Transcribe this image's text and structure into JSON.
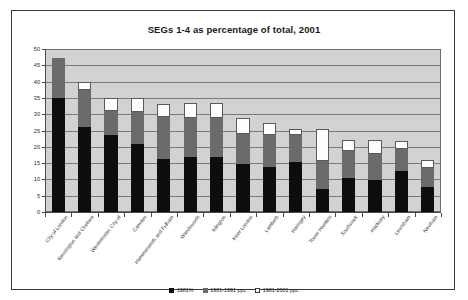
{
  "chart_data": {
    "type": "bar",
    "title": "SEGs 1-4 as percentage of total, 2001",
    "xlabel": "",
    "ylabel": "",
    "ylim": [
      0,
      50
    ],
    "ytick_step": 5,
    "yticks": [
      "0",
      "5",
      "10",
      "15",
      "20",
      "25",
      "30",
      "35",
      "40",
      "45",
      "50"
    ],
    "grid": true,
    "stacked": true,
    "legend_position": "bottom",
    "plot_background": "#d2d2d2",
    "categories": [
      "City of London",
      "Kensington and Chelsea",
      "Westminster, City of",
      "Camden",
      "Hammersmith and Fulham",
      "Wandsworth",
      "Islington",
      "Inner London",
      "Lambeth",
      "Haringey",
      "Tower Hamlets",
      "Southwark",
      "Hackney",
      "Lewisham",
      "Newham"
    ],
    "series": [
      {
        "name": "1981%",
        "color": "#0d0d0d",
        "values": [
          35.0,
          26.2,
          23.6,
          21.0,
          16.4,
          17.0,
          17.0,
          14.8,
          13.7,
          15.2,
          7.2,
          10.5,
          9.8,
          12.6,
          7.8
        ]
      },
      {
        "name": "1981-1991 ppc",
        "color": "#6b6b6b",
        "values": [
          12.1,
          11.3,
          7.3,
          9.6,
          12.8,
          11.7,
          11.7,
          9.2,
          10.0,
          8.4,
          8.4,
          8.3,
          8.0,
          6.8,
          5.7
        ]
      },
      {
        "name": "1981-2001 ppc",
        "color": "#ffffff",
        "values": [
          0.0,
          2.5,
          4.1,
          4.4,
          3.8,
          4.7,
          4.7,
          4.7,
          3.6,
          1.9,
          9.9,
          3.4,
          4.4,
          2.3,
          2.6
        ]
      }
    ],
    "totals": [
      47.1,
      40.0,
      35.0,
      35.0,
      33.0,
      33.4,
      33.4,
      28.7,
      27.3,
      25.5,
      25.5,
      22.2,
      22.2,
      21.7,
      16.1
    ]
  },
  "legend": {
    "items": [
      {
        "label": "1981%",
        "swatch": "black-square-icon"
      },
      {
        "label": "1981-1991 ppc",
        "swatch": "gray-square-icon"
      },
      {
        "label": "1981-2001 ppc",
        "swatch": "white-square-icon"
      }
    ]
  }
}
